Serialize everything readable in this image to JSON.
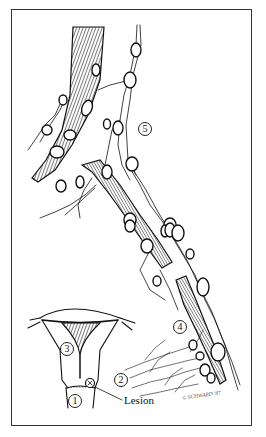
{
  "figure": {
    "type": "medical-illustration",
    "border_color": "#333333",
    "ink_color": "#111111"
  },
  "labels": [
    {
      "id": "1",
      "text": "1",
      "x": 75,
      "y": 401
    },
    {
      "id": "2",
      "text": "2",
      "x": 121,
      "y": 380
    },
    {
      "id": "3",
      "text": "3",
      "x": 67,
      "y": 349
    },
    {
      "id": "4",
      "text": "4",
      "x": 180,
      "y": 327
    },
    {
      "id": "5",
      "text": "5",
      "x": 145,
      "y": 129
    }
  ],
  "annotations": {
    "lesion": "Lesion",
    "signature": "© SCHWARD '87"
  }
}
